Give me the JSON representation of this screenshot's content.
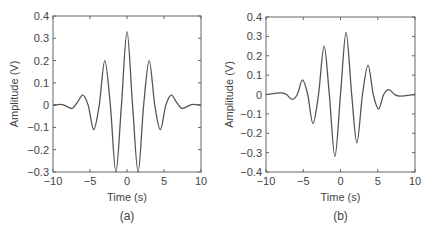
{
  "chart_data": [
    {
      "type": "line",
      "panel_label": "(a)",
      "title": "",
      "xlabel": "Time (s)",
      "ylabel": "Amplitude (V)",
      "xlim": [
        -10,
        10
      ],
      "ylim": [
        -0.3,
        0.4
      ],
      "xticks": [
        -10,
        -5,
        0,
        5,
        10
      ],
      "xtick_labels": [
        "−10",
        "−5",
        "0",
        "5",
        "10"
      ],
      "yticks": [
        -0.3,
        -0.2,
        -0.1,
        0,
        0.1,
        0.2,
        0.3,
        0.4
      ],
      "ytick_labels": [
        "−0.3",
        "−0.2",
        "−0.1",
        "0",
        "0.1",
        "0.2",
        "0.3",
        "0.4"
      ],
      "grid": false,
      "legend": null,
      "series": [
        {
          "name": "symmetric wavelet",
          "x": [
            -10,
            -9,
            -8.5,
            -7.5,
            -6.75,
            -6,
            -5.25,
            -4.5,
            -3.75,
            -3,
            -2.25,
            -1.5,
            -0.75,
            0,
            0.75,
            1.5,
            2.25,
            3,
            3.75,
            4.5,
            5.25,
            6,
            6.75,
            7.5,
            8.5,
            9,
            10
          ],
          "y": [
            0,
            0.003,
            0,
            -0.015,
            0.01,
            0.045,
            0,
            -0.11,
            0,
            0.2,
            0,
            -0.3,
            0,
            0.33,
            0,
            -0.3,
            0,
            0.2,
            0,
            -0.11,
            0,
            0.045,
            0.01,
            -0.015,
            0,
            0.003,
            0
          ]
        }
      ]
    },
    {
      "type": "line",
      "panel_label": "(b)",
      "title": "",
      "xlabel": "Time (s)",
      "ylabel": "Amplitude (V)",
      "xlim": [
        -10,
        10
      ],
      "ylim": [
        -0.4,
        0.4
      ],
      "xticks": [
        -10,
        -5,
        0,
        5,
        10
      ],
      "xtick_labels": [
        "−10",
        "−5",
        "0",
        "5",
        "10"
      ],
      "yticks": [
        -0.4,
        -0.3,
        -0.2,
        -0.1,
        0,
        0.1,
        0.2,
        0.3,
        0.4
      ],
      "ytick_labels": [
        "−0.4",
        "−0.3",
        "−0.2",
        "−0.1",
        "0",
        "0.1",
        "0.2",
        "0.3",
        "0.4"
      ],
      "grid": false,
      "legend": null,
      "series": [
        {
          "name": "antisymmetric wavelet",
          "x": [
            -10,
            -8,
            -7.25,
            -6.5,
            -5.8,
            -5.1,
            -4.4,
            -3.7,
            -2.95,
            -2.2,
            -1.5,
            -0.75,
            0,
            0.75,
            1.5,
            2.2,
            2.95,
            3.7,
            4.4,
            5.1,
            5.8,
            6.5,
            7.25,
            8,
            10
          ],
          "y": [
            0,
            0.008,
            0,
            -0.025,
            0,
            0.075,
            0,
            -0.15,
            0,
            0.25,
            0,
            -0.32,
            0,
            0.32,
            0,
            -0.25,
            0,
            0.15,
            0,
            -0.075,
            0,
            0.025,
            0,
            -0.008,
            0
          ]
        }
      ]
    }
  ]
}
